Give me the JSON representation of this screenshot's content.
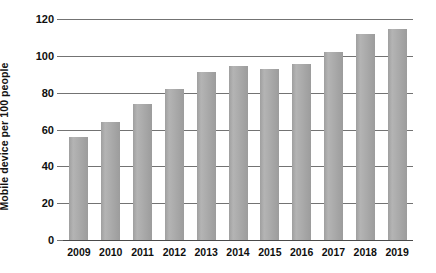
{
  "chart_data": {
    "type": "bar",
    "title": "",
    "subtitle": "",
    "xlabel": "",
    "ylabel": "Mobile device per 100 people",
    "categories": [
      "2009",
      "2010",
      "2011",
      "2012",
      "2013",
      "2014",
      "2015",
      "2016",
      "2017",
      "2018",
      "2019"
    ],
    "values": [
      56,
      64,
      74,
      82,
      91,
      94.5,
      93,
      95.5,
      102,
      112,
      114.5
    ],
    "series": [
      {
        "name": "Mobile device per 100 people",
        "values": [
          56,
          64,
          74,
          82,
          91,
          94.5,
          93,
          95.5,
          102,
          112,
          114.5
        ]
      }
    ],
    "ylim": [
      0,
      120
    ],
    "yticks": [
      0,
      20,
      40,
      60,
      80,
      100,
      120
    ],
    "ytick_labels": [
      "0",
      "20",
      "40",
      "60",
      "80",
      "100",
      "120"
    ],
    "grid": true,
    "grid_axis": "y",
    "legend": false,
    "legend_position": "none",
    "bar_color": "#aaaaaa",
    "gridline_color": "#737373",
    "axis_color": "#4a4a4a",
    "text_color": "#0f0f0f",
    "background_color": "#ffffff"
  }
}
